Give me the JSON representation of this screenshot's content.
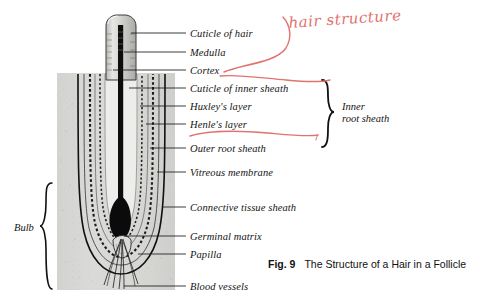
{
  "figure": {
    "caption_number": "Fig. 9",
    "caption_text": "The Structure of a Hair in a Follicle",
    "handwritten_annotation": "hair structure",
    "annotation_color": "#e0736f",
    "ink_color": "#141414"
  },
  "labels": [
    {
      "id": "cuticle-of-hair",
      "text": "Cuticle of hair",
      "y": 28,
      "leader_x_start": 131,
      "leader_y": 33
    },
    {
      "id": "medulla",
      "text": "Medulla",
      "y": 47,
      "leader_x_start": 124,
      "leader_y": 52
    },
    {
      "id": "cortex",
      "text": "Cortex",
      "y": 65,
      "leader_x_start": 113,
      "leader_y": 70
    },
    {
      "id": "cuticle-of-inner-sheath",
      "text": "Cuticle of inner sheath",
      "y": 83,
      "leader_x_start": 129,
      "leader_y": 88
    },
    {
      "id": "huxleys-layer",
      "text": "Huxley's layer",
      "y": 101,
      "leader_x_start": 140,
      "leader_y": 106
    },
    {
      "id": "henles-layer",
      "text": "Henle's layer",
      "y": 119,
      "leader_x_start": 146,
      "leader_y": 124
    },
    {
      "id": "outer-root-sheath",
      "text": "Outer root sheath",
      "y": 143,
      "leader_x_start": 150,
      "leader_y": 148
    },
    {
      "id": "vitreous-membrane",
      "text": "Vitreous membrane",
      "y": 167,
      "leader_x_start": 157,
      "leader_y": 172
    },
    {
      "id": "connective-tissue-sheath",
      "text": "Connective tissue sheath",
      "y": 202,
      "leader_x_start": 163,
      "leader_y": 207
    },
    {
      "id": "germinal-matrix",
      "text": "Germinal matrix",
      "y": 231,
      "leader_x_start": 124,
      "leader_y": 236
    },
    {
      "id": "papilla",
      "text": "Papilla",
      "y": 249,
      "leader_x_start": 138,
      "leader_y": 254
    },
    {
      "id": "blood-vessels",
      "text": "Blood vessels",
      "y": 281,
      "leader_x_start": 124,
      "leader_y": 286
    }
  ],
  "brace_labels": [
    {
      "id": "inner-root-sheath",
      "text": "Inner\nroot sheath",
      "x": 342,
      "y": 101
    }
  ],
  "side_labels": [
    {
      "id": "bulb",
      "text": "Bulb"
    }
  ],
  "anatomy_parts": [
    "hair shaft",
    "follicle tissue block",
    "dermal papilla",
    "blood vessels",
    "hair bulb"
  ]
}
